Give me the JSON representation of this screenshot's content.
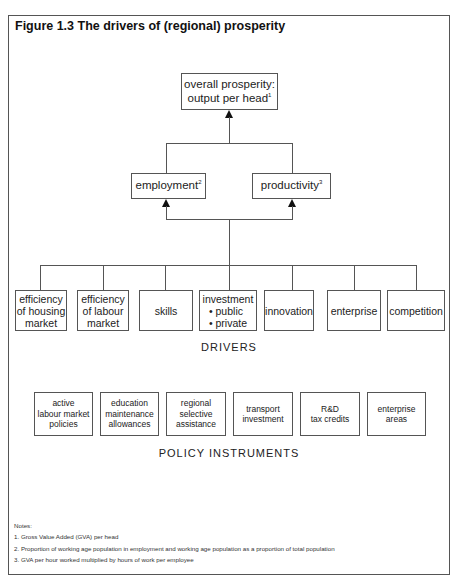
{
  "figure": {
    "title": "Figure 1.3 The drivers of (regional) prosperity"
  },
  "top": {
    "line1": "overall prosperity:",
    "line2": "output per head",
    "note_ref": "1"
  },
  "middle": [
    {
      "label": "employment",
      "note_ref": "2"
    },
    {
      "label": "productivity",
      "note_ref": "3"
    }
  ],
  "drivers": {
    "caption": "DRIVERS",
    "items": [
      {
        "lines": [
          "efficiency",
          "of housing",
          "market"
        ]
      },
      {
        "lines": [
          "efficiency",
          "of labour",
          "market"
        ]
      },
      {
        "lines": [
          "skills"
        ]
      },
      {
        "title": "investment",
        "bullets": [
          "public",
          "private"
        ]
      },
      {
        "lines": [
          "innovation"
        ]
      },
      {
        "lines": [
          "enterprise"
        ]
      },
      {
        "lines": [
          "competition"
        ]
      }
    ]
  },
  "policy": {
    "caption": "POLICY INSTRUMENTS",
    "items": [
      {
        "lines": [
          "active",
          "labour market",
          "policies"
        ]
      },
      {
        "lines": [
          "education",
          "maintenance",
          "allowances"
        ]
      },
      {
        "lines": [
          "regional",
          "selective",
          "assistance"
        ]
      },
      {
        "lines": [
          "transport",
          "investment"
        ]
      },
      {
        "lines": [
          "R&D",
          "tax credits"
        ]
      },
      {
        "lines": [
          "enterprise",
          "areas"
        ]
      }
    ]
  },
  "notes": {
    "heading": "Notes:",
    "items": [
      "1. Gross Value Added (GVA) per head",
      "2. Proportion of working age population in employment and working age population as a proportion of total population",
      "3. GVA per hour worked multiplied by hours of work per employee"
    ]
  },
  "colors": {
    "line": "#555555",
    "arrow": "#111111",
    "background": "#ffffff"
  }
}
